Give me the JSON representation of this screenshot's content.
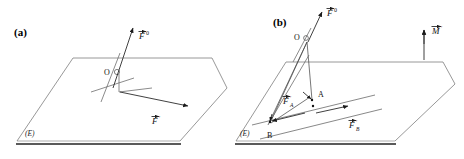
{
  "figure": {
    "background_color": "#ffffff",
    "line_color": "#7d7d7d",
    "ink_color": "#111111",
    "panels": [
      {
        "id": "a",
        "label": "(a)",
        "plane_label": "(E)",
        "origin_label": "O",
        "vectors": [
          {
            "id": "F0",
            "base": "F",
            "superscript": "0",
            "label_text": "F⃗0"
          },
          {
            "id": "Fprime",
            "base": "F",
            "superscript": "'",
            "label_text": "F⃗'"
          }
        ]
      },
      {
        "id": "b",
        "label": "(b)",
        "plane_label": "(E)",
        "origin_label": "O",
        "point_a_label": "A",
        "point_b_label": "B",
        "vectors": [
          {
            "id": "F0",
            "base": "F",
            "superscript": "0",
            "label_text": "F⃗0"
          },
          {
            "id": "FA",
            "base": "F",
            "subscript": "A",
            "superscript": "'",
            "label_text": "F⃗'ₐ"
          },
          {
            "id": "FB",
            "base": "F",
            "subscript": "B",
            "superscript": "'",
            "label_text": "F⃗'ʙ"
          },
          {
            "id": "Mprime",
            "base": "M",
            "superscript": "'",
            "label_text": "M⃗'"
          }
        ]
      }
    ],
    "glyphs": {
      "vector_arrow_accent": "→",
      "prime": "'",
      "superscript_zero": "0"
    }
  }
}
